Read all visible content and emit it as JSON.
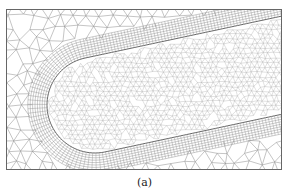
{
  "figure": {
    "caption": "(a)",
    "colors": {
      "background": "#ffffff",
      "mesh_line": "#8a8a8a",
      "frame": "#666666",
      "boundary_layer": "#555555"
    }
  }
}
